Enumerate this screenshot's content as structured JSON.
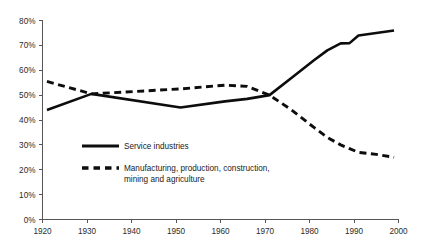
{
  "chart_data": {
    "type": "line",
    "title": "",
    "subtitle": "",
    "xlabel": "",
    "ylabel": "",
    "xlim": [
      1920,
      2000
    ],
    "ylim": [
      0,
      80
    ],
    "grid": false,
    "legend_position": "inside-lower-left",
    "x_tick_labels": [
      "1920",
      "1930",
      "1940",
      "1950",
      "1960",
      "1970",
      "1980",
      "1990",
      "2000"
    ],
    "x_ticks": [
      1920,
      1930,
      1940,
      1950,
      1960,
      1970,
      1980,
      1990,
      2000
    ],
    "y_tick_labels": [
      "0%",
      "10%",
      "20%",
      "30%",
      "40%",
      "50%",
      "60%",
      "70%",
      "80%"
    ],
    "y_ticks": [
      0,
      10,
      20,
      30,
      40,
      50,
      60,
      70,
      80
    ],
    "series": [
      {
        "name": "Service industries",
        "style": "solid",
        "color": "#0d0d0d",
        "x": [
          1921,
          1931,
          1951,
          1961,
          1966,
          1971,
          1976,
          1981,
          1984,
          1987,
          1989,
          1991,
          1995,
          1999
        ],
        "values": [
          44,
          50.5,
          45,
          47.5,
          48.5,
          50,
          57,
          64,
          68,
          70.8,
          70.9,
          74,
          75,
          76
        ]
      },
      {
        "name": "Manufacturing, production, construction, mining and agriculture",
        "style": "dashed",
        "color": "#0d0d0d",
        "x": [
          1921,
          1931,
          1951,
          1961,
          1966,
          1971,
          1976,
          1981,
          1984,
          1987,
          1989,
          1991,
          1995,
          1999
        ],
        "values": [
          55.5,
          50.5,
          52.5,
          54,
          53.5,
          50,
          44,
          37,
          33,
          30,
          28.5,
          27,
          26.2,
          25
        ]
      }
    ]
  },
  "legend": {
    "entries": [
      {
        "label": "Service industries",
        "label2": "",
        "style": "solid"
      },
      {
        "label": "Manufacturing, production, construction,",
        "label2": "mining and agriculture",
        "style": "dashed"
      }
    ]
  },
  "colors": {
    "ink": "#0d0d0d",
    "axis": "#55555a",
    "background": "#ffffff"
  }
}
